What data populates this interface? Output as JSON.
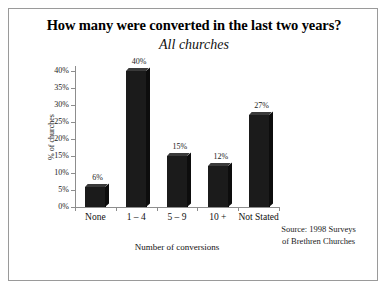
{
  "chart_data": {
    "type": "bar",
    "title": "How many were converted in the last two years?",
    "subtitle": "All churches",
    "categories": [
      "None",
      "1 – 4",
      "5 – 9",
      "10 +",
      "Not Stated"
    ],
    "values": [
      6,
      40,
      15,
      12,
      27
    ],
    "data_labels": [
      "6%",
      "40%",
      "15%",
      "12%",
      "27%"
    ],
    "xlabel": "Number of conversions",
    "ylabel": "% of churches",
    "ylim": [
      0,
      40
    ],
    "ytick_labels": [
      "0%",
      "5%",
      "10%",
      "15%",
      "20%",
      "25%",
      "30%",
      "35%",
      "40%"
    ],
    "ytick_values": [
      0,
      5,
      10,
      15,
      20,
      25,
      30,
      35,
      40
    ],
    "grid": false,
    "legend": "none",
    "bar_color": "#1b1b1b",
    "axis_color": "#8d8d8d",
    "frame_color": "#9a9a9a"
  },
  "source_note": {
    "line1": "Source: 1998 Surveys",
    "line2": "of Brethren Churches"
  }
}
